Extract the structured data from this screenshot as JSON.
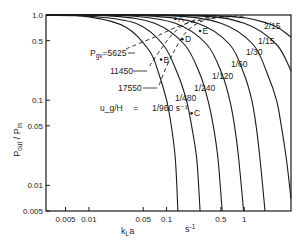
{
  "chart_data": {
    "type": "line",
    "title": "",
    "xlabel": "k_L a",
    "xunit": "s-1",
    "ylabel": "P_out / P_in",
    "xscale": "log",
    "yscale": "log",
    "xlim": [
      0.0028,
      4.0
    ],
    "ylim": [
      0.005,
      1.0
    ],
    "grid": false,
    "x_ticks": [
      {
        "value": 0.005,
        "label": "0.005"
      },
      {
        "value": 0.01,
        "label": "0.01"
      },
      {
        "value": 0.05,
        "label": "0.05"
      },
      {
        "value": 0.1,
        "label": "0.1"
      },
      {
        "value": 0.5,
        "label": "0.5"
      },
      {
        "value": 1,
        "label": "1"
      }
    ],
    "y_ticks": [
      {
        "value": 1.0,
        "label": "1.0"
      },
      {
        "value": 0.5,
        "label": "0.5"
      },
      {
        "value": 0.1,
        "label": "0.1"
      },
      {
        "value": 0.05,
        "label": "0.05"
      },
      {
        "value": 0.01,
        "label": "0.01"
      },
      {
        "value": 0.005,
        "label": "0.005"
      }
    ],
    "parameter_label": "u_g/H",
    "parameter_equals": "=",
    "series": [
      {
        "name": "1/960 s-1",
        "label": "1/960 s⁻¹",
        "style": "solid",
        "points": [
          [
            0.0028,
            0.99
          ],
          [
            0.01,
            0.95
          ],
          [
            0.03,
            0.72
          ],
          [
            0.06,
            0.38
          ],
          [
            0.08,
            0.2
          ],
          [
            0.1,
            0.1
          ],
          [
            0.115,
            0.05
          ],
          [
            0.13,
            0.02
          ],
          [
            0.14,
            0.005
          ]
        ]
      },
      {
        "name": "1/480",
        "label": "1/480",
        "style": "solid",
        "points": [
          [
            0.0028,
            0.995
          ],
          [
            0.01,
            0.97
          ],
          [
            0.04,
            0.8
          ],
          [
            0.09,
            0.45
          ],
          [
            0.14,
            0.2
          ],
          [
            0.18,
            0.1
          ],
          [
            0.21,
            0.05
          ],
          [
            0.245,
            0.02
          ],
          [
            0.27,
            0.005
          ]
        ]
      },
      {
        "name": "1/240",
        "label": "1/240",
        "style": "solid",
        "points": [
          [
            0.0028,
            0.997
          ],
          [
            0.02,
            0.97
          ],
          [
            0.07,
            0.8
          ],
          [
            0.17,
            0.45
          ],
          [
            0.27,
            0.2
          ],
          [
            0.34,
            0.1
          ],
          [
            0.4,
            0.05
          ],
          [
            0.46,
            0.02
          ],
          [
            0.52,
            0.005
          ]
        ]
      },
      {
        "name": "1/120",
        "label": "1/120",
        "style": "solid",
        "points": [
          [
            0.0028,
            0.998
          ],
          [
            0.03,
            0.98
          ],
          [
            0.13,
            0.8
          ],
          [
            0.33,
            0.45
          ],
          [
            0.52,
            0.2
          ],
          [
            0.65,
            0.1
          ],
          [
            0.75,
            0.05
          ],
          [
            0.85,
            0.02
          ],
          [
            0.98,
            0.005
          ]
        ]
      },
      {
        "name": "1/60",
        "label": "1/60",
        "style": "solid",
        "points": [
          [
            0.0028,
            0.999
          ],
          [
            0.05,
            0.985
          ],
          [
            0.25,
            0.8
          ],
          [
            0.65,
            0.45
          ],
          [
            1.0,
            0.2
          ],
          [
            1.25,
            0.1
          ],
          [
            1.42,
            0.05
          ],
          [
            1.6,
            0.02
          ],
          [
            1.85,
            0.005
          ]
        ]
      },
      {
        "name": "1/30",
        "label": "1/30",
        "style": "solid",
        "points": [
          [
            0.0028,
            0.999
          ],
          [
            0.1,
            0.985
          ],
          [
            0.5,
            0.8
          ],
          [
            1.3,
            0.45
          ],
          [
            2.0,
            0.2
          ],
          [
            2.6,
            0.1
          ],
          [
            3.0,
            0.05
          ],
          [
            3.5,
            0.02
          ],
          [
            4.0,
            0.007
          ]
        ]
      },
      {
        "name": "1/15",
        "label": "1/15",
        "style": "solid",
        "points": [
          [
            0.0028,
            0.9995
          ],
          [
            0.2,
            0.985
          ],
          [
            1.0,
            0.8
          ],
          [
            2.6,
            0.45
          ],
          [
            4.0,
            0.22
          ]
        ]
      },
      {
        "name": "2/15",
        "label": "2/15",
        "style": "solid",
        "points": [
          [
            0.0028,
            0.9998
          ],
          [
            0.4,
            0.985
          ],
          [
            2.0,
            0.8
          ],
          [
            4.0,
            0.55
          ]
        ]
      }
    ],
    "iso_pressure_lines": [
      {
        "name": "P_gv=5625",
        "label_prefix": "P",
        "label_sub": "gv",
        "label_value": "=5625",
        "style": "dashed",
        "points": [
          [
            0.03,
            0.4
          ],
          [
            0.07,
            0.55
          ],
          [
            0.15,
            0.75
          ],
          [
            0.3,
            0.88
          ],
          [
            0.6,
            0.95
          ],
          [
            1.0,
            0.97
          ]
        ]
      },
      {
        "name": "11450",
        "label": "11450",
        "style": "dashed",
        "points": [
          [
            0.06,
            0.25
          ],
          [
            0.085,
            0.4
          ],
          [
            0.12,
            0.6
          ],
          [
            0.18,
            0.8
          ],
          [
            0.3,
            0.92
          ],
          [
            0.6,
            0.97
          ]
        ]
      },
      {
        "name": "17550",
        "label": "17550",
        "style": "dashed",
        "points": [
          [
            0.08,
            0.15
          ],
          [
            0.1,
            0.25
          ],
          [
            0.13,
            0.4
          ],
          [
            0.17,
            0.6
          ],
          [
            0.25,
            0.8
          ],
          [
            0.4,
            0.92
          ],
          [
            0.8,
            0.98
          ]
        ]
      }
    ],
    "annotations": [
      {
        "text": "A",
        "x": 0.13,
        "y": 0.9
      },
      {
        "text": "B",
        "x": 0.085,
        "y": 0.3
      },
      {
        "text": "C",
        "x": 0.21,
        "y": 0.07
      },
      {
        "text": "D",
        "x": 0.16,
        "y": 0.52
      },
      {
        "text": "E",
        "x": 0.27,
        "y": 0.65
      }
    ]
  }
}
